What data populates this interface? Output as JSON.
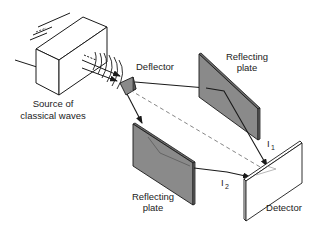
{
  "diagram": {
    "labels": {
      "source_line1": "Source of",
      "source_line2": "classical waves",
      "deflector": "Deflector",
      "plate_top_line1": "Reflecting",
      "plate_top_line2": "plate",
      "plate_bottom_line1": "Reflecting",
      "plate_bottom_line2": "plate",
      "detector": "Detector",
      "i1_main": "I",
      "i1_sub": "1",
      "i2_main": "I",
      "i2_sub": "2"
    },
    "colors": {
      "line": "#1a1a1a",
      "plate_fill": "#8a8a8a",
      "plate_edge": "#6a6a6a",
      "box_fill": "#ffffff",
      "dashed": "#777777",
      "background": "#ffffff"
    },
    "components": [
      "source",
      "deflector",
      "reflecting-plate-top",
      "reflecting-plate-bottom",
      "detector"
    ],
    "beams": [
      "source-to-deflector",
      "deflector-to-top-plate",
      "top-plate-to-detector (I1)",
      "deflector-to-bottom-plate",
      "bottom-plate-to-detector (I2)",
      "deflector-to-detector (dashed)"
    ]
  }
}
